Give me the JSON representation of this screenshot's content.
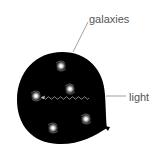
{
  "diagram": {
    "labels": {
      "galaxies": "galaxies",
      "light": "light"
    },
    "colors": {
      "balloon": "#000000",
      "leader_line": "#888888",
      "label_text": "#555555",
      "galaxy_glow": "#cfcfcf",
      "wave": "#bbbbbb"
    },
    "galaxies": [
      {
        "x": 61,
        "y": 66
      },
      {
        "x": 36,
        "y": 96
      },
      {
        "x": 70,
        "y": 89
      },
      {
        "x": 86,
        "y": 119
      },
      {
        "x": 53,
        "y": 128
      }
    ]
  }
}
